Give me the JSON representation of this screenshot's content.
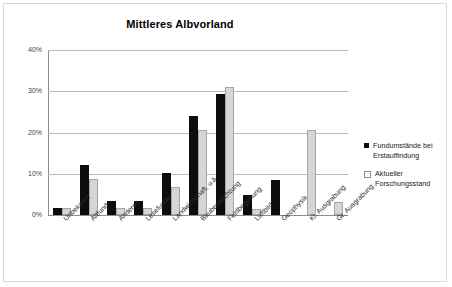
{
  "chart_data": {
    "type": "bar",
    "title": "Mittleres Albvorland",
    "xlabel": "",
    "ylabel": "",
    "ylim": [
      0,
      40
    ],
    "ytick_labels": [
      "0%",
      "10%",
      "20%",
      "30%",
      "40%"
    ],
    "ytick_values": [
      0,
      10,
      20,
      30,
      40
    ],
    "grid": true,
    "legend_position": "right",
    "categories": [
      "Unbekannt",
      "Altfund",
      "Anderes",
      "Lesefunde",
      "Landwirtschaft, u.ä.",
      "Baubeobachtung",
      "Feldbegehung",
      "Luftbild",
      "Geophysik",
      "Kl. Ausgrabung",
      "Gr. Ausgrabung"
    ],
    "series": [
      {
        "name": "Fundumstände bei Erstauffindung",
        "color": "#0d0d0d",
        "values": [
          1.6,
          12.2,
          3.3,
          3.3,
          10.3,
          24.2,
          29.6,
          5.0,
          8.6,
          0,
          0
        ]
      },
      {
        "name": "Aktueller Forschungsstand",
        "color": "#d6d6d6",
        "values": [
          1.7,
          8.9,
          1.6,
          1.6,
          6.9,
          20.8,
          31.3,
          1.5,
          0,
          20.8,
          3.2
        ]
      }
    ]
  },
  "legend": {
    "items": [
      {
        "label_line1": "Fundumstände bei",
        "label_line2": "Erstauffindung",
        "marker": "filled-square"
      },
      {
        "label_line1": "Aktueller",
        "label_line2": "Forschungsstand",
        "marker": "outlined-square"
      }
    ]
  }
}
